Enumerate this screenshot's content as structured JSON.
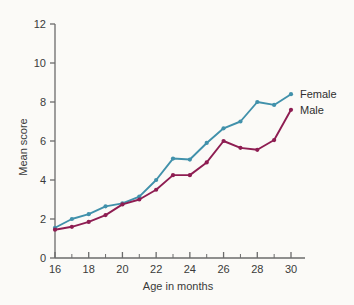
{
  "chart_data": {
    "type": "line",
    "title": "",
    "xlabel": "Age in months",
    "ylabel": "Mean score",
    "x": [
      16,
      17,
      18,
      19,
      20,
      21,
      22,
      23,
      24,
      25,
      26,
      27,
      28,
      29,
      30
    ],
    "xlim": [
      16,
      30
    ],
    "ylim": [
      0,
      12
    ],
    "xticks": [
      16,
      18,
      20,
      22,
      24,
      26,
      28,
      30
    ],
    "xtick_labels": [
      "16",
      "18",
      "20",
      "22",
      "24",
      "26",
      "28",
      "30"
    ],
    "xminor_ticks": [
      17,
      19,
      21,
      23,
      25,
      27,
      29
    ],
    "yticks": [
      0,
      2,
      4,
      6,
      8,
      10,
      12
    ],
    "ytick_labels": [
      "0",
      "2",
      "4",
      "6",
      "8",
      "10",
      "12"
    ],
    "grid": false,
    "legend_position": "right-inline-end-of-line",
    "series": [
      {
        "name": "Female",
        "color": "#4191ab",
        "values": [
          1.55,
          2.0,
          2.25,
          2.65,
          2.8,
          3.15,
          4.0,
          5.1,
          5.05,
          5.9,
          6.65,
          7.0,
          8.0,
          7.85,
          8.4
        ]
      },
      {
        "name": "Male",
        "color": "#8e1d52",
        "values": [
          1.45,
          1.6,
          1.85,
          2.2,
          2.75,
          3.0,
          3.5,
          4.25,
          4.25,
          4.9,
          6.0,
          5.65,
          5.55,
          6.05,
          7.6
        ]
      }
    ]
  },
  "axes": {
    "y_title": "Mean score",
    "x_title": "Age in months"
  },
  "legend": {
    "female_label": "Female",
    "male_label": "Male"
  },
  "colors": {
    "female": "#4191ab",
    "male": "#8e1d52",
    "axis": "#6b6b6b",
    "background": "#fbfaf7",
    "text": "#3a3a3a"
  }
}
